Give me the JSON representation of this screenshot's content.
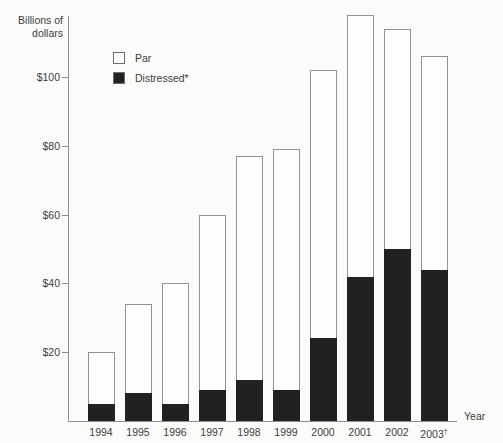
{
  "chart_data": {
    "type": "bar",
    "stacked": true,
    "title": "",
    "ylabel_lines": [
      "Billions of",
      "dollars"
    ],
    "xlabel": "Year",
    "categories": [
      "1994",
      "1995",
      "1996",
      "1997",
      "1998",
      "1999",
      "2000",
      "2001",
      "2002",
      "2003"
    ],
    "category_sups": [
      "",
      "",
      "",
      "",
      "",
      "",
      "",
      "",
      "",
      "†"
    ],
    "series": [
      {
        "name": "Par",
        "color": "#fdfdfc",
        "values": [
          15,
          26,
          35,
          51,
          65,
          70,
          78,
          76,
          64,
          62
        ]
      },
      {
        "name": "Distressed*",
        "color": "#23211f",
        "values": [
          5,
          8,
          5,
          9,
          12,
          9,
          24,
          42,
          50,
          44
        ]
      }
    ],
    "totals": [
      20,
      34,
      40,
      60,
      77,
      79,
      102,
      118,
      114,
      106
    ],
    "yticks": [
      {
        "value": 20,
        "label": "$20"
      },
      {
        "value": 40,
        "label": "$40"
      },
      {
        "value": 60,
        "label": "$60"
      },
      {
        "value": 80,
        "label": "$80"
      },
      {
        "value": 100,
        "label": "$100"
      }
    ],
    "ylim": [
      0,
      120
    ],
    "grid": false,
    "legend_position": "top-left-inside"
  },
  "colors": {
    "background": "#fbfbf9",
    "axis": "#8f8f8f",
    "bar_outline": "#939393",
    "distressed_fill": "#23211f",
    "text": "#3d3d3d"
  }
}
